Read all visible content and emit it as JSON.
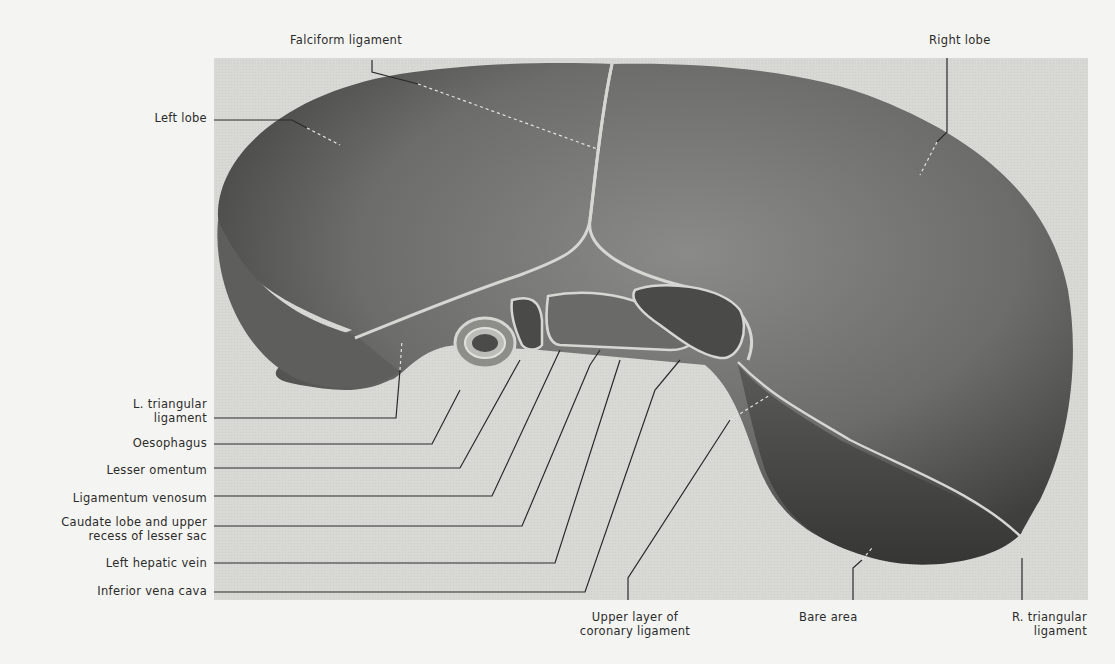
{
  "figure": {
    "colors": {
      "page_background": "#f4f4f2",
      "plate_background": "#d9d9d6",
      "liver_fill": "#6e6e6c",
      "liver_shadow": "#3e3e3d",
      "peritoneum_line": "#cfcfcb",
      "leader_line": "#2a2a2a"
    }
  },
  "labels": {
    "top": [
      {
        "id": "falciform_ligament",
        "text": "Falciform ligament"
      },
      {
        "id": "right_lobe",
        "text": "Right lobe"
      }
    ],
    "left": [
      {
        "id": "left_lobe",
        "text": "Left lobe"
      },
      {
        "id": "l_triangular_ligament",
        "lines": [
          "L. triangular",
          "ligament"
        ]
      },
      {
        "id": "oesophagus",
        "text": "Oesophagus"
      },
      {
        "id": "lesser_omentum",
        "text": "Lesser omentum"
      },
      {
        "id": "ligamentum_venosum",
        "text": "Ligamentum venosum"
      },
      {
        "id": "caudate_lobe",
        "lines": [
          "Caudate lobe and upper",
          "recess of lesser sac"
        ]
      },
      {
        "id": "left_hepatic_vein",
        "text": "Left hepatic vein"
      },
      {
        "id": "inferior_vena_cava",
        "text": "Inferior vena cava"
      }
    ],
    "bottom": [
      {
        "id": "upper_layer_coronary",
        "lines": [
          "Upper layer of",
          "coronary ligament"
        ]
      },
      {
        "id": "bare_area",
        "text": "Bare area"
      },
      {
        "id": "r_triangular_ligament",
        "lines": [
          "R. triangular",
          "ligament"
        ]
      }
    ]
  }
}
